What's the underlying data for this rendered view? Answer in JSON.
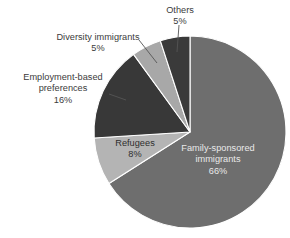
{
  "chart_data": {
    "type": "pie",
    "title": "",
    "xlabel": "",
    "ylabel": "",
    "units": "percent",
    "start_angle_deg": 0,
    "direction": "clockwise",
    "legend": "none",
    "grid": false,
    "categories": [
      "Family-sponsored immigrants",
      "Refugees",
      "Employment-based preferences",
      "Diversity immigrants",
      "Others"
    ],
    "values": [
      66,
      8,
      16,
      5,
      5
    ],
    "slices": [
      {
        "label": "Family-sponsored immigrants",
        "label_line1": "Family-sponsored",
        "label_line2": "immigrants",
        "value": 66,
        "percent_text": "66%",
        "color": "#6e6e6e",
        "label_placement": "inside",
        "text_color": "#e9e9e9"
      },
      {
        "label": "Refugees",
        "label_line1": "Refugees",
        "label_line2": "",
        "value": 8,
        "percent_text": "8%",
        "color": "#b4b4b4",
        "label_placement": "inside",
        "text_color": "#2e2e2e"
      },
      {
        "label": "Employment-based preferences",
        "label_line1": "Employment-based",
        "label_line2": "preferences",
        "value": 16,
        "percent_text": "16%",
        "color": "#383838",
        "label_placement": "outside",
        "text_color": "#3b3b3b"
      },
      {
        "label": "Diversity immigrants",
        "label_line1": "Diversity immigrants",
        "label_line2": "",
        "value": 5,
        "percent_text": "5%",
        "color": "#a8a8a8",
        "label_placement": "outside",
        "text_color": "#3b3b3b"
      },
      {
        "label": "Others",
        "label_line1": "Others",
        "label_line2": "",
        "value": 5,
        "percent_text": "5%",
        "color": "#3a3a3a",
        "label_placement": "outside",
        "text_color": "#3b3b3b"
      }
    ],
    "background_color": "#ffffff",
    "slice_border_color": "#ffffff",
    "leader_line_color": "#555555"
  }
}
